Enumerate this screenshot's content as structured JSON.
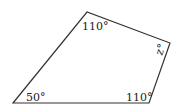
{
  "diagram": {
    "shape": "quadrilateral",
    "stroke_color": "#333333",
    "vertices": [
      {
        "name": "bottom-left",
        "x": 13,
        "y": 103,
        "angle_label": "50°"
      },
      {
        "name": "top",
        "x": 87,
        "y": 12,
        "angle_label": "110°"
      },
      {
        "name": "right",
        "x": 170,
        "y": 43,
        "angle_label": "z°"
      },
      {
        "name": "bottom-right",
        "x": 149,
        "y": 103,
        "angle_label": "110°"
      }
    ]
  }
}
